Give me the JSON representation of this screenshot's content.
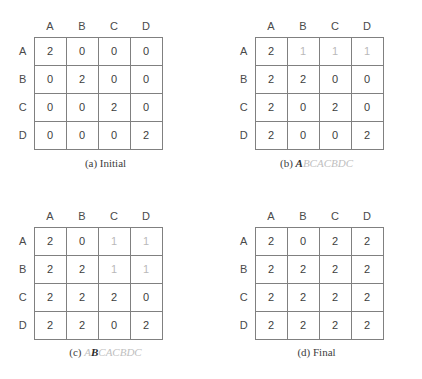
{
  "figure": {
    "title": "",
    "column_headers": [
      "A",
      "B",
      "C",
      "D"
    ],
    "row_headers": [
      "A",
      "B",
      "C",
      "D"
    ]
  },
  "panels": [
    {
      "id": "a",
      "caption_index": "(a)",
      "caption_text": "Initial",
      "caption_kind": "plain",
      "sequence_prefix": "",
      "sequence_current": "",
      "sequence_suffix": "",
      "rows": [
        {
          "label": "A",
          "cells": [
            {
              "value": "2",
              "dim": false
            },
            {
              "value": "0",
              "dim": false
            },
            {
              "value": "0",
              "dim": false
            },
            {
              "value": "0",
              "dim": false
            }
          ]
        },
        {
          "label": "B",
          "cells": [
            {
              "value": "0",
              "dim": false
            },
            {
              "value": "2",
              "dim": false
            },
            {
              "value": "0",
              "dim": false
            },
            {
              "value": "0",
              "dim": false
            }
          ]
        },
        {
          "label": "C",
          "cells": [
            {
              "value": "0",
              "dim": false
            },
            {
              "value": "0",
              "dim": false
            },
            {
              "value": "2",
              "dim": false
            },
            {
              "value": "0",
              "dim": false
            }
          ]
        },
        {
          "label": "D",
          "cells": [
            {
              "value": "0",
              "dim": false
            },
            {
              "value": "0",
              "dim": false
            },
            {
              "value": "0",
              "dim": false
            },
            {
              "value": "2",
              "dim": false
            }
          ]
        }
      ],
      "highlight": {
        "row": null,
        "col": null
      }
    },
    {
      "id": "b",
      "caption_index": "(b)",
      "caption_text": "ABCACBDC",
      "caption_kind": "sequence",
      "sequence_prefix": "",
      "sequence_current": "A",
      "sequence_suffix": "BCACBDC",
      "rows": [
        {
          "label": "A",
          "cells": [
            {
              "value": "2",
              "dim": false
            },
            {
              "value": "1",
              "dim": true
            },
            {
              "value": "1",
              "dim": true
            },
            {
              "value": "1",
              "dim": true
            }
          ]
        },
        {
          "label": "B",
          "cells": [
            {
              "value": "2",
              "dim": false
            },
            {
              "value": "2",
              "dim": false
            },
            {
              "value": "0",
              "dim": false
            },
            {
              "value": "0",
              "dim": false
            }
          ]
        },
        {
          "label": "C",
          "cells": [
            {
              "value": "2",
              "dim": false
            },
            {
              "value": "0",
              "dim": false
            },
            {
              "value": "2",
              "dim": false
            },
            {
              "value": "0",
              "dim": false
            }
          ]
        },
        {
          "label": "D",
          "cells": [
            {
              "value": "2",
              "dim": false
            },
            {
              "value": "0",
              "dim": false
            },
            {
              "value": "0",
              "dim": false
            },
            {
              "value": "2",
              "dim": false
            }
          ]
        }
      ],
      "highlight": {
        "row": 0,
        "col": 0
      }
    },
    {
      "id": "c",
      "caption_index": "(c)",
      "caption_text": "ABCACBDC",
      "caption_kind": "sequence",
      "sequence_prefix": "A",
      "sequence_current": "B",
      "sequence_suffix": "CACBDC",
      "rows": [
        {
          "label": "A",
          "cells": [
            {
              "value": "2",
              "dim": false
            },
            {
              "value": "0",
              "dim": false
            },
            {
              "value": "1",
              "dim": true
            },
            {
              "value": "1",
              "dim": true
            }
          ]
        },
        {
          "label": "B",
          "cells": [
            {
              "value": "2",
              "dim": false
            },
            {
              "value": "2",
              "dim": false
            },
            {
              "value": "1",
              "dim": true
            },
            {
              "value": "1",
              "dim": true
            }
          ]
        },
        {
          "label": "C",
          "cells": [
            {
              "value": "2",
              "dim": false
            },
            {
              "value": "2",
              "dim": false
            },
            {
              "value": "2",
              "dim": false
            },
            {
              "value": "0",
              "dim": false
            }
          ]
        },
        {
          "label": "D",
          "cells": [
            {
              "value": "2",
              "dim": false
            },
            {
              "value": "2",
              "dim": false
            },
            {
              "value": "0",
              "dim": false
            },
            {
              "value": "2",
              "dim": false
            }
          ]
        }
      ],
      "highlight": {
        "row": 1,
        "col": 1
      }
    },
    {
      "id": "d",
      "caption_index": "(d)",
      "caption_text": "Final",
      "caption_kind": "plain",
      "sequence_prefix": "",
      "sequence_current": "",
      "sequence_suffix": "",
      "rows": [
        {
          "label": "A",
          "cells": [
            {
              "value": "2",
              "dim": false
            },
            {
              "value": "0",
              "dim": false
            },
            {
              "value": "2",
              "dim": false
            },
            {
              "value": "2",
              "dim": false
            }
          ]
        },
        {
          "label": "B",
          "cells": [
            {
              "value": "2",
              "dim": false
            },
            {
              "value": "2",
              "dim": false
            },
            {
              "value": "2",
              "dim": false
            },
            {
              "value": "2",
              "dim": false
            }
          ]
        },
        {
          "label": "C",
          "cells": [
            {
              "value": "2",
              "dim": false
            },
            {
              "value": "2",
              "dim": false
            },
            {
              "value": "2",
              "dim": false
            },
            {
              "value": "2",
              "dim": false
            }
          ]
        },
        {
          "label": "D",
          "cells": [
            {
              "value": "2",
              "dim": false
            },
            {
              "value": "2",
              "dim": false
            },
            {
              "value": "2",
              "dim": false
            },
            {
              "value": "2",
              "dim": false
            }
          ]
        }
      ],
      "highlight": {
        "row": null,
        "col": null
      }
    }
  ],
  "colors": {
    "grid_line": "#808080",
    "highlight_line": "#1c1c1c",
    "value_text": "#3d3d3d",
    "value_text_dim": "#b9b9b9",
    "caption_text": "#3d3d3d",
    "caption_sequence_inactive": "#c0c0c0",
    "background": "#ffffff"
  }
}
